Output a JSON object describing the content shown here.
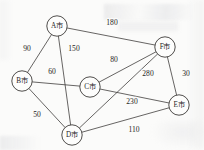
{
  "figure": {
    "node_radius": 10.2,
    "stroke_color": "#3c3a38",
    "background_color": "#fbfbfa",
    "text_color": "#26241f"
  },
  "nodes": [
    {
      "id": "A",
      "label": "A市",
      "x": 57,
      "y": 26
    },
    {
      "id": "B",
      "label": "B市",
      "x": 22,
      "y": 81
    },
    {
      "id": "C",
      "label": "C市",
      "x": 90,
      "y": 87
    },
    {
      "id": "D",
      "label": "D市",
      "x": 72,
      "y": 135
    },
    {
      "id": "E",
      "label": "E市",
      "x": 179,
      "y": 105
    },
    {
      "id": "F",
      "label": "F市",
      "x": 165,
      "y": 47
    }
  ],
  "edges": [
    {
      "id": "A-F",
      "from": "A",
      "to": "F",
      "weight": "180",
      "label_x": 112,
      "label_y": 22
    },
    {
      "id": "A-B",
      "from": "A",
      "to": "B",
      "weight": "90",
      "label_x": 27,
      "label_y": 48
    },
    {
      "id": "A-D",
      "from": "A",
      "to": "D",
      "weight": "150",
      "label_x": 74,
      "label_y": 48
    },
    {
      "id": "B-C",
      "from": "B",
      "to": "C",
      "weight": "60",
      "label_x": 52,
      "label_y": 71
    },
    {
      "id": "B-D",
      "from": "B",
      "to": "D",
      "weight": "50",
      "label_x": 37,
      "label_y": 114
    },
    {
      "id": "C-F",
      "from": "C",
      "to": "F",
      "weight": "80",
      "label_x": 114,
      "label_y": 59
    },
    {
      "id": "C-E",
      "from": "C",
      "to": "E",
      "weight": "230",
      "label_x": 132,
      "label_y": 101
    },
    {
      "id": "D-F",
      "from": "D",
      "to": "F",
      "weight": "280",
      "label_x": 148,
      "label_y": 73
    },
    {
      "id": "D-E",
      "from": "D",
      "to": "E",
      "weight": "110",
      "label_x": 134,
      "label_y": 129
    },
    {
      "id": "F-E",
      "from": "F",
      "to": "E",
      "weight": "30",
      "label_x": 186,
      "label_y": 73
    }
  ],
  "chart_data": {
    "type": "diagram",
    "graph_type": "undirected-weighted-graph",
    "title": "",
    "node_labels": [
      "A市",
      "B市",
      "C市",
      "D市",
      "E市",
      "F市"
    ],
    "edge_list": [
      {
        "source": "A市",
        "target": "F市",
        "weight": 180
      },
      {
        "source": "A市",
        "target": "B市",
        "weight": 90
      },
      {
        "source": "A市",
        "target": "D市",
        "weight": 150
      },
      {
        "source": "B市",
        "target": "C市",
        "weight": 60
      },
      {
        "source": "B市",
        "target": "D市",
        "weight": 50
      },
      {
        "source": "C市",
        "target": "F市",
        "weight": 80
      },
      {
        "source": "C市",
        "target": "E市",
        "weight": 230
      },
      {
        "source": "D市",
        "target": "F市",
        "weight": 280
      },
      {
        "source": "D市",
        "target": "E市",
        "weight": 110
      },
      {
        "source": "F市",
        "target": "E市",
        "weight": 30
      }
    ]
  }
}
